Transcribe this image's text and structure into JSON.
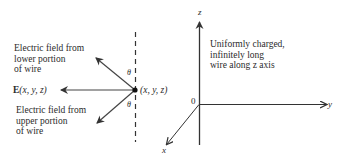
{
  "figure": {
    "left_panel": {
      "lower_field_label": "Electric field from\nlower portion\nof wire",
      "upper_field_label": "Electric field from\nupper portion\nof wire",
      "resultant_label": "E(x, y, z)",
      "point_label": "(x, y, z)",
      "angle_upper": "θ",
      "angle_lower": "θ"
    },
    "right_panel": {
      "wire_description": "Uniformly charged,\ninfinitely long\nwire along z axis",
      "axis_z": "z",
      "axis_y": "y",
      "axis_x": "x",
      "origin": "0"
    }
  }
}
